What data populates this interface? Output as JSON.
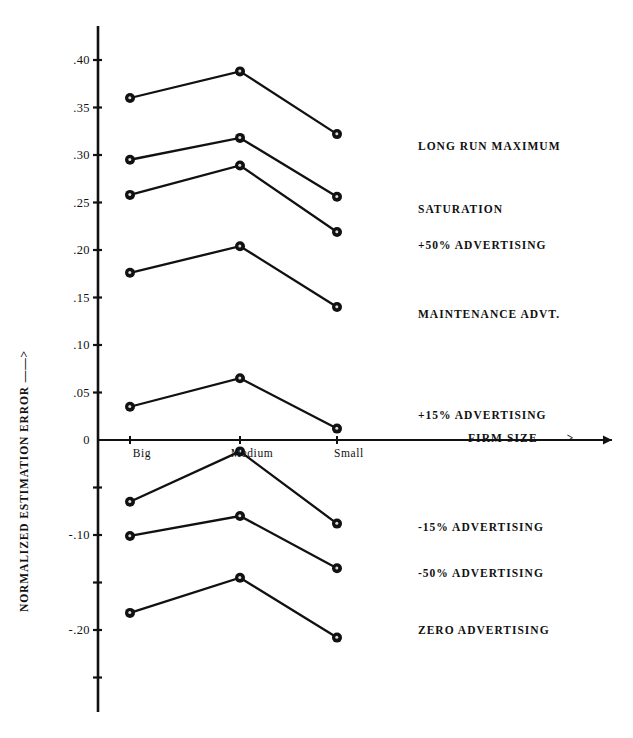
{
  "chart_data": {
    "type": "line",
    "title": "",
    "xlabel": "FIRM SIZE ——>",
    "ylabel": "NORMALIZED ESTIMATION ERROR ——>",
    "categories": [
      "Big",
      "Medium",
      "Small"
    ],
    "ylim": [
      -0.25,
      0.4
    ],
    "ytick_values": [
      0.4,
      0.35,
      0.3,
      0.25,
      0.2,
      0.15,
      0.1,
      0.05,
      0.0,
      -0.05,
      -0.1,
      -0.15,
      -0.2,
      -0.25
    ],
    "ytick_labels": [
      ".40",
      ".35",
      ".30",
      ".25",
      ".20",
      ".15",
      ".10",
      ".05",
      "0",
      "",
      "-.10",
      "",
      "-.20",
      ""
    ],
    "grid": false,
    "legend_position": "right-inline",
    "marker": "filled-circle",
    "series": [
      {
        "name": "LONG RUN MAXIMUM",
        "values": [
          0.36,
          0.388,
          0.322
        ],
        "label_y": 0.31
      },
      {
        "name": "SATURATION",
        "values": [
          0.295,
          0.318,
          0.256
        ],
        "label_y": 0.243
      },
      {
        "name": "+50% ADVERTISING",
        "values": [
          0.258,
          0.289,
          0.219
        ],
        "label_y": 0.205
      },
      {
        "name": "MAINTENANCE ADVT.",
        "values": [
          0.176,
          0.204,
          0.14
        ],
        "label_y": 0.133
      },
      {
        "name": "+15% ADVERTISING",
        "values": [
          0.035,
          0.065,
          0.012
        ],
        "label_y": 0.026
      },
      {
        "name": "-15% ADVERTISING",
        "values": [
          -0.065,
          -0.012,
          -0.088
        ],
        "label_y": -0.092
      },
      {
        "name": "-50% ADVERTISING",
        "values": [
          -0.101,
          -0.08,
          -0.135
        ],
        "label_y": -0.14
      },
      {
        "name": "ZERO ADVERTISING",
        "values": [
          -0.182,
          -0.145,
          -0.208
        ],
        "label_y": -0.2
      }
    ]
  },
  "axes": {
    "y_title": "NORMALIZED ESTIMATION ERROR ——>",
    "x_title": "FIRM SIZE ——>",
    "x_categories": [
      {
        "label": "Big"
      },
      {
        "label": "Medium"
      },
      {
        "label": "Small"
      }
    ],
    "y_ticks": [
      {
        "label": ".40"
      },
      {
        "label": ".35"
      },
      {
        "label": ".30"
      },
      {
        "label": ".25"
      },
      {
        "label": ".20"
      },
      {
        "label": ".15"
      },
      {
        "label": ".10"
      },
      {
        "label": ".05"
      },
      {
        "label": "0"
      },
      {
        "label": "-.10"
      },
      {
        "label": "-.20"
      }
    ]
  },
  "legend": {
    "items": [
      {
        "label": "LONG RUN MAXIMUM"
      },
      {
        "label": "SATURATION"
      },
      {
        "label": "+50% ADVERTISING"
      },
      {
        "label": "MAINTENANCE ADVT."
      },
      {
        "label": "+15% ADVERTISING"
      },
      {
        "label": "-15% ADVERTISING"
      },
      {
        "label": "-50% ADVERTISING"
      },
      {
        "label": "ZERO ADVERTISING"
      }
    ]
  },
  "colors": {
    "ink": "#111111",
    "background": "#ffffff"
  }
}
